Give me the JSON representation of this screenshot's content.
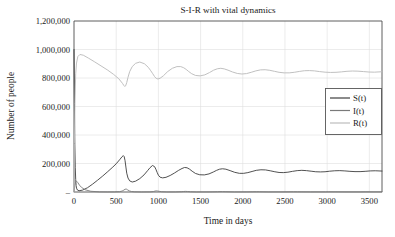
{
  "chart_data": {
    "type": "line",
    "title": "S-I-R with vital dynamics",
    "xlabel": "Time in days",
    "ylabel": "Number of people",
    "xlim": [
      0,
      3650
    ],
    "ylim": [
      0,
      1200000
    ],
    "grid": true,
    "legend_position": "right-middle",
    "x_ticks": [
      {
        "value": 0,
        "label": "0"
      },
      {
        "value": 500,
        "label": "500"
      },
      {
        "value": 1000,
        "label": "1000"
      },
      {
        "value": 1500,
        "label": "1500"
      },
      {
        "value": 2000,
        "label": "2000"
      },
      {
        "value": 2500,
        "label": "2500"
      },
      {
        "value": 3000,
        "label": "3000"
      },
      {
        "value": 3500,
        "label": "3500"
      }
    ],
    "y_ticks": [
      {
        "value": 0,
        "label": "–"
      },
      {
        "value": 200000,
        "label": "200,000"
      },
      {
        "value": 400000,
        "label": "400,000"
      },
      {
        "value": 600000,
        "label": "600,000"
      },
      {
        "value": 800000,
        "label": "800,000"
      },
      {
        "value": 1000000,
        "label": "1,000,000"
      },
      {
        "value": 1200000,
        "label": "1,200,000"
      }
    ],
    "legend": [
      {
        "name": "S(t)",
        "color": "#3d3d3d"
      },
      {
        "name": "I(t)",
        "color": "#7a7a7a"
      },
      {
        "name": "R(t)",
        "color": "#bdbdbd"
      }
    ],
    "series": [
      {
        "name": "S(t)",
        "color": "#3d3d3d",
        "x": [
          0,
          5,
          10,
          15,
          20,
          25,
          30,
          40,
          60,
          100,
          160,
          220,
          280,
          340,
          400,
          460,
          500,
          540,
          570,
          585,
          595,
          605,
          615,
          625,
          640,
          660,
          690,
          730,
          780,
          830,
          875,
          900,
          930,
          955,
          970,
          985,
          1000,
          1020,
          1050,
          1090,
          1140,
          1190,
          1240,
          1280,
          1310,
          1340,
          1370,
          1400,
          1440,
          1490,
          1545,
          1600,
          1650,
          1690,
          1725,
          1760,
          1800,
          1850,
          1905,
          1960,
          2010,
          2060,
          2110,
          2160,
          2215,
          2270,
          2325,
          2380,
          2430,
          2480,
          2535,
          2590,
          2645,
          2700,
          2755,
          2810,
          2865,
          2920,
          2975,
          3030,
          3090,
          3150,
          3210,
          3270,
          3330,
          3390,
          3450,
          3510,
          3570,
          3650
        ],
        "y": [
          1000000,
          620000,
          330000,
          170000,
          88000,
          46000,
          27000,
          14000,
          9000,
          13000,
          30000,
          55000,
          83000,
          112000,
          143000,
          175000,
          198000,
          226000,
          248000,
          255000,
          248000,
          220000,
          175000,
          132000,
          98000,
          78000,
          70000,
          76000,
          94000,
          120000,
          152000,
          170000,
          186000,
          178000,
          160000,
          138000,
          118000,
          104000,
          99000,
          103000,
          116000,
          133000,
          152000,
          165000,
          172000,
          170000,
          160000,
          146000,
          130000,
          121000,
          120000,
          127000,
          140000,
          152000,
          160000,
          163000,
          160000,
          150000,
          138000,
          131000,
          131000,
          136000,
          144000,
          152000,
          156000,
          155000,
          149000,
          142000,
          137000,
          136000,
          139000,
          145000,
          150000,
          152000,
          150000,
          146000,
          142000,
          141000,
          142000,
          146000,
          149000,
          150000,
          148000,
          145000,
          143000,
          143000,
          145000,
          148000,
          149000,
          147000
        ]
      },
      {
        "name": "I(t)",
        "color": "#7a7a7a",
        "x": [
          0,
          10,
          20,
          30,
          45,
          65,
          90,
          130,
          200,
          300,
          400,
          480,
          540,
          570,
          590,
          605,
          620,
          635,
          655,
          680,
          720,
          800,
          900,
          940,
          960,
          975,
          990,
          1010,
          1040,
          1100,
          1200,
          1270,
          1300,
          1320,
          1345,
          1380,
          1450,
          1600,
          1700,
          1730,
          1760,
          1800,
          1900,
          2050,
          2120,
          2160,
          2200,
          2300,
          2500,
          2560,
          2600,
          2650,
          2800,
          2980,
          3020,
          3070,
          3200,
          3400,
          3450,
          3500,
          3650
        ],
        "y": [
          1000,
          46000,
          72000,
          76000,
          66000,
          48000,
          32000,
          16000,
          5000,
          1200,
          600,
          900,
          2400,
          6500,
          13000,
          19500,
          20500,
          15000,
          8000,
          3600,
          1400,
          400,
          900,
          3200,
          6200,
          7800,
          7000,
          4600,
          2200,
          600,
          700,
          2200,
          3600,
          4200,
          3600,
          2000,
          600,
          800,
          1900,
          2600,
          2700,
          2100,
          700,
          900,
          1700,
          2000,
          1800,
          800,
          900,
          1500,
          1700,
          1500,
          800,
          1000,
          1400,
          1400,
          900,
          1000,
          1300,
          1200,
          1000
        ]
      },
      {
        "name": "R(t)",
        "color": "#bdbdbd",
        "x": [
          0,
          5,
          12,
          20,
          30,
          45,
          70,
          110,
          170,
          240,
          320,
          400,
          470,
          530,
          575,
          590,
          600,
          612,
          625,
          640,
          660,
          690,
          730,
          780,
          835,
          880,
          905,
          930,
          955,
          975,
          995,
          1020,
          1060,
          1110,
          1165,
          1220,
          1265,
          1300,
          1330,
          1360,
          1395,
          1440,
          1495,
          1550,
          1605,
          1655,
          1700,
          1740,
          1780,
          1825,
          1880,
          1935,
          1990,
          2045,
          2100,
          2155,
          2210,
          2265,
          2320,
          2375,
          2430,
          2490,
          2550,
          2610,
          2670,
          2730,
          2790,
          2850,
          2910,
          2975,
          3040,
          3105,
          3170,
          3235,
          3300,
          3365,
          3430,
          3495,
          3560,
          3650
        ],
        "y": [
          0,
          340000,
          640000,
          830000,
          905000,
          950000,
          965000,
          960000,
          940000,
          915000,
          885000,
          855000,
          825000,
          795000,
          762000,
          748000,
          741000,
          745000,
          768000,
          805000,
          845000,
          880000,
          903000,
          912000,
          900000,
          875000,
          855000,
          833000,
          810000,
          797000,
          793000,
          798000,
          816000,
          845000,
          868000,
          880000,
          880000,
          872000,
          860000,
          845000,
          830000,
          818000,
          815000,
          822000,
          838000,
          855000,
          865000,
          868000,
          864000,
          855000,
          842000,
          832000,
          828000,
          831000,
          840000,
          850000,
          857000,
          858000,
          854000,
          847000,
          840000,
          836000,
          836000,
          840000,
          846000,
          851000,
          852000,
          850000,
          845000,
          841000,
          839000,
          840000,
          843000,
          847000,
          849000,
          848000,
          845000,
          842000,
          841000,
          844000
        ]
      }
    ]
  }
}
